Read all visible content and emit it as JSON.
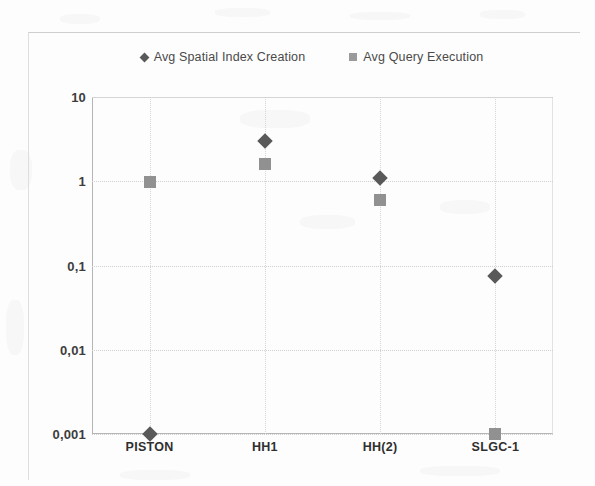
{
  "chart_data": {
    "type": "scatter",
    "title": "",
    "subtitle": "",
    "xlabel": "",
    "ylabel": "",
    "yscale": "log",
    "ylim": [
      0.001,
      10
    ],
    "grid": true,
    "legend_position": "top",
    "categories": [
      "PISTON",
      "HH1",
      "HH(2)",
      "SLGC-1"
    ],
    "ytick_labels": [
      "10",
      "1",
      "0,1",
      "0,01",
      "0,001"
    ],
    "ytick_values": [
      10,
      1,
      0.1,
      0.01,
      0.001
    ],
    "series": [
      {
        "name": "Avg Spatial Index Creation",
        "marker": "diamond",
        "color": "#595959",
        "values": [
          0.001,
          3.0,
          1.1,
          0.075
        ]
      },
      {
        "name": "Avg Query Execution",
        "marker": "square",
        "color": "#919191",
        "values": [
          0.98,
          1.6,
          0.6,
          0.001
        ]
      }
    ]
  },
  "legend": {
    "entries": [
      {
        "label": "Avg Spatial Index Creation",
        "marker": "diamond"
      },
      {
        "label": "Avg Query Execution",
        "marker": "square"
      }
    ]
  },
  "colors": {
    "series_1": "#595959",
    "series_2": "#919191",
    "grid": "#d0d0d0",
    "axis": "#b5b5b5",
    "text": "#3d3d3d"
  }
}
